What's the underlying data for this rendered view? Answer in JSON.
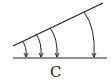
{
  "diagram": {
    "label": "C",
    "colors": {
      "stroke": "#222222",
      "background": "#ffffff"
    },
    "slanted_line": {
      "x1": 13,
      "y1": 46,
      "x2": 103,
      "y2": 3
    },
    "baseline": {
      "x1": 13,
      "y1": 58,
      "x2": 107,
      "y2": 58
    },
    "arrows": [
      {
        "start_x": 22,
        "end_x": 26
      },
      {
        "start_x": 36,
        "end_x": 41
      },
      {
        "start_x": 50,
        "end_x": 57
      },
      {
        "start_x": 84,
        "end_x": 94
      }
    ]
  }
}
